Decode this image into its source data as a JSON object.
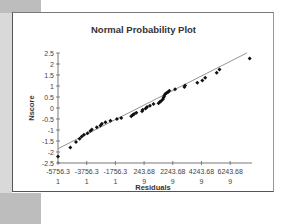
{
  "chart_data": {
    "type": "scatter",
    "title": "Normal Probability Plot",
    "xlabel": "Residuals",
    "ylabel": "Nscore",
    "x_tick_labels": [
      "-5756.31",
      "-3756.31",
      "-1756.31",
      "243.689",
      "2243.689",
      "4243.689",
      "6243.689"
    ],
    "x_ticks": [
      -5756.31,
      -3756.31,
      -1756.31,
      243.689,
      2243.689,
      4243.689,
      6243.689
    ],
    "y_tick_labels": [
      "2.5",
      "2",
      "1.5",
      "1",
      "0.5",
      "0",
      "-0.5",
      "-1",
      "-1.5",
      "-2",
      "-2.5"
    ],
    "y_ticks": [
      2.5,
      2,
      1.5,
      1,
      0.5,
      0,
      -0.5,
      -1,
      -1.5,
      -2,
      -2.5
    ],
    "xlim": [
      -5756.31,
      7600
    ],
    "ylim": [
      -2.5,
      2.5
    ],
    "grid": false,
    "legend": null,
    "series": [
      {
        "name": "Nscore",
        "marker": "diamond",
        "points": [
          [
            -5756,
            -2.2
          ],
          [
            -4900,
            -1.8
          ],
          [
            -4500,
            -1.55
          ],
          [
            -4250,
            -1.4
          ],
          [
            -4100,
            -1.3
          ],
          [
            -3950,
            -1.22
          ],
          [
            -3700,
            -1.15
          ],
          [
            -3500,
            -1.05
          ],
          [
            -3400,
            -0.98
          ],
          [
            -3050,
            -0.88
          ],
          [
            -2800,
            -0.8
          ],
          [
            -2700,
            -0.72
          ],
          [
            -2450,
            -0.65
          ],
          [
            -2100,
            -0.58
          ],
          [
            -1650,
            -0.5
          ],
          [
            -1350,
            -0.45
          ],
          [
            -650,
            -0.38
          ],
          [
            -550,
            -0.32
          ],
          [
            -450,
            -0.27
          ],
          [
            -300,
            -0.22
          ],
          [
            100,
            -0.15
          ],
          [
            150,
            -0.08
          ],
          [
            350,
            -0.02
          ],
          [
            450,
            0.05
          ],
          [
            650,
            0.1
          ],
          [
            900,
            0.18
          ],
          [
            1250,
            0.22
          ],
          [
            1350,
            0.28
          ],
          [
            1450,
            0.33
          ],
          [
            1550,
            0.4
          ],
          [
            1600,
            0.48
          ],
          [
            1650,
            0.55
          ],
          [
            1700,
            0.62
          ],
          [
            1800,
            0.68
          ],
          [
            1900,
            0.72
          ],
          [
            2000,
            0.78
          ],
          [
            2400,
            0.85
          ],
          [
            3050,
            0.95
          ],
          [
            3100,
            1.02
          ],
          [
            3950,
            1.15
          ],
          [
            4300,
            1.25
          ],
          [
            4500,
            1.38
          ],
          [
            5300,
            1.6
          ],
          [
            5500,
            1.75
          ],
          [
            7600,
            2.25
          ]
        ]
      }
    ],
    "trendline": {
      "x": [
        -5756.31,
        7400
      ],
      "y": [
        -1.85,
        2.5
      ]
    }
  }
}
